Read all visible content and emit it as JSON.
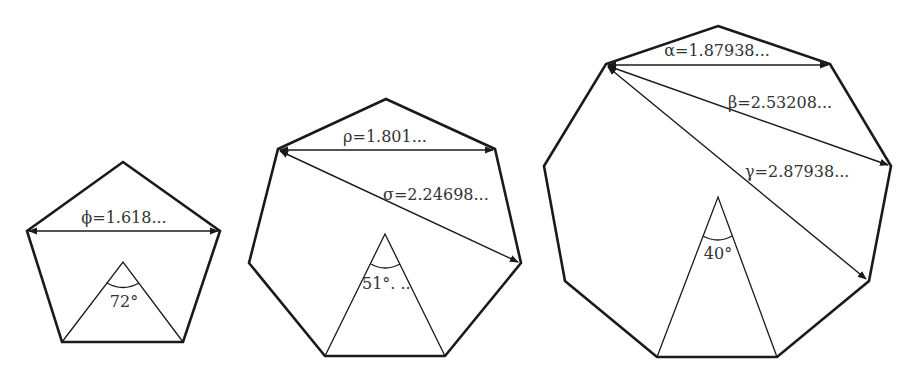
{
  "figure": {
    "colors": {
      "stroke": "#1a1a1a",
      "text": "#333333",
      "background": "#ffffff"
    },
    "pentagon": {
      "sides": 5,
      "diagonals": [
        {
          "symbol": "ϕ",
          "label": "ϕ=1.618..."
        }
      ],
      "central_angle_label": "72°"
    },
    "heptagon": {
      "sides": 7,
      "diagonals": [
        {
          "symbol": "ρ",
          "label": "ρ=1.801..."
        },
        {
          "symbol": "σ",
          "label": "σ=2.24698..."
        }
      ],
      "central_angle_label": "51°. .."
    },
    "nonagon": {
      "sides": 9,
      "diagonals": [
        {
          "symbol": "α",
          "label": "α=1.87938..."
        },
        {
          "symbol": "β",
          "label": "β=2.53208..."
        },
        {
          "symbol": "γ",
          "label": "γ=2.87938..."
        }
      ],
      "central_angle_label": "40°"
    }
  }
}
